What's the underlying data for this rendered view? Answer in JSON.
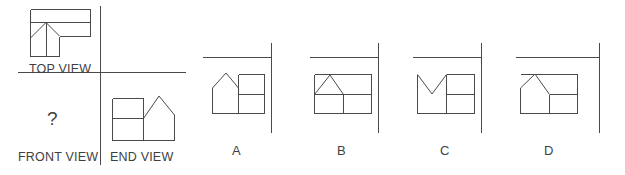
{
  "puzzle": {
    "type": "orthographic-projection-missing-view",
    "line_color": "#4a4a4a",
    "background_color": "#ffffff",
    "text_color": "#3f3f3f"
  },
  "given_views": {
    "top_view": {
      "label": "TOP VIEW",
      "description": "L-shaped plan with a horizontal band across the top and a vertical leg at the left, two short diagonals meeting at an apex point plus a center vertical line"
    },
    "front_view": {
      "label": "FRONT VIEW",
      "placeholder": "?",
      "description": "missing view, marked with a question mark"
    },
    "end_view": {
      "label": "END VIEW",
      "description": "rectangle on the left split by a horizontal line, pentagon house shape with peaked roof on the right"
    }
  },
  "options": [
    {
      "letter": "A",
      "description": "house silhouette with apex above the left half, rectangle with horizontal divider on the right"
    },
    {
      "letter": "B",
      "description": "rectangle with a triangular peak over the left half touching the top edge, horizontal divider at mid height, vertical divider at center"
    },
    {
      "letter": "C",
      "description": "rectangle whose left half is a V notch cut down from the top, right half divided by a horizontal line"
    },
    {
      "letter": "D",
      "description": "rectangle with a peaked roof over the left half, vertical divider at center and horizontal divider on the right half only"
    }
  ]
}
